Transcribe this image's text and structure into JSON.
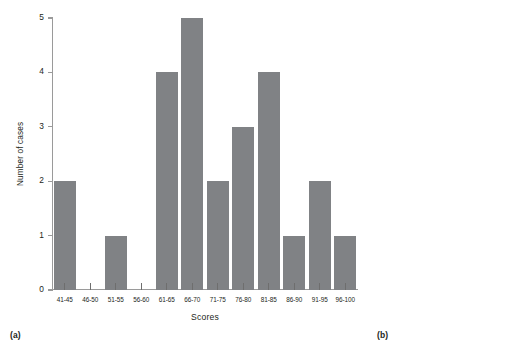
{
  "figure": {
    "panels": [
      {
        "tag": "(a)",
        "ylabel": "Number of cases",
        "xlabel": "Scores",
        "bar_color": "#808285",
        "axis_color": "#9a9a9a"
      },
      {
        "tag": "(b)",
        "ylabel": "Number of cases",
        "xlabel": "",
        "bar_color": "#58595b",
        "axis_color": "#9a9a9a"
      }
    ]
  },
  "chart_data": [
    {
      "type": "bar",
      "title": "",
      "panel": "(a)",
      "categories": [
        "41-45",
        "46-50",
        "51-55",
        "56-60",
        "61-65",
        "66-70",
        "71-75",
        "76-80",
        "81-85",
        "86-90",
        "91-95",
        "96-100"
      ],
      "values": [
        2,
        0,
        1,
        0,
        4,
        5,
        2,
        3,
        4,
        1,
        2,
        1
      ],
      "xlabel": "Scores",
      "ylabel": "Number of cases",
      "ylim": [
        0,
        5
      ],
      "yticks": [
        0,
        1,
        2,
        3,
        4,
        5
      ],
      "ytick_labels": [
        "0",
        "1",
        "2",
        "3",
        "4",
        "5"
      ],
      "grid": false,
      "legend": "none",
      "color": "#808285"
    },
    {
      "type": "bar",
      "title": "",
      "panel": "(b)",
      "categories": [
        "Pass",
        "Fail"
      ],
      "values": [
        18,
        7
      ],
      "xlabel": "",
      "ylabel": "Number of cases",
      "ylim": [
        0,
        20
      ],
      "yticks": [
        0,
        4,
        8,
        12,
        16,
        20
      ],
      "ytick_labels": [
        "0",
        "4",
        "8",
        "12",
        "16",
        "20"
      ],
      "grid": false,
      "legend": "none",
      "color": "#58595b"
    }
  ]
}
